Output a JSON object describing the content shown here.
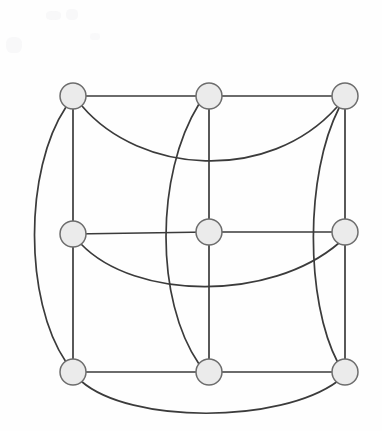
{
  "figure": {
    "canvas": {
      "width": 382,
      "height": 431
    },
    "background_color": "#fefefe",
    "edge_color": "#3b3b3b",
    "vertex_fill_color": "#ebebeb",
    "vertex_stroke_color": "#6d6d6d",
    "vertex_radius": 13,
    "edge_stroke_width": 1.7,
    "vertex_count": 9,
    "edge_count": 18,
    "vertices": [
      {
        "id": "v1",
        "name": "top-left",
        "row": 0,
        "col": 0,
        "cx": 73,
        "cy": 96,
        "degree": 4
      },
      {
        "id": "v2",
        "name": "top-center",
        "row": 0,
        "col": 1,
        "cx": 209,
        "cy": 96,
        "degree": 4
      },
      {
        "id": "v3",
        "name": "top-right",
        "row": 0,
        "col": 2,
        "cx": 345,
        "cy": 96,
        "degree": 4
      },
      {
        "id": "v4",
        "name": "middle-left",
        "row": 1,
        "col": 0,
        "cx": 73,
        "cy": 234,
        "degree": 4
      },
      {
        "id": "v5",
        "name": "middle-center",
        "row": 1,
        "col": 1,
        "cx": 209,
        "cy": 232,
        "degree": 4
      },
      {
        "id": "v6",
        "name": "middle-right",
        "row": 1,
        "col": 2,
        "cx": 345,
        "cy": 232,
        "degree": 4
      },
      {
        "id": "v7",
        "name": "bottom-left",
        "row": 2,
        "col": 0,
        "cx": 73,
        "cy": 372,
        "degree": 4
      },
      {
        "id": "v8",
        "name": "bottom-center",
        "row": 2,
        "col": 1,
        "cx": 209,
        "cy": 372,
        "degree": 4
      },
      {
        "id": "v9",
        "name": "bottom-right",
        "row": 2,
        "col": 2,
        "cx": 345,
        "cy": 372,
        "degree": 4
      }
    ],
    "edges": [
      {
        "id": "e1",
        "from": "v1",
        "to": "v2",
        "kind": "straight",
        "path": "M 73 96 L 209 96"
      },
      {
        "id": "e2",
        "from": "v2",
        "to": "v3",
        "kind": "straight",
        "path": "M 209 96 L 345 96"
      },
      {
        "id": "e3",
        "from": "v4",
        "to": "v5",
        "kind": "straight",
        "path": "M 73 234 L 209 232"
      },
      {
        "id": "e4",
        "from": "v5",
        "to": "v6",
        "kind": "straight",
        "path": "M 209 232 L 345 232"
      },
      {
        "id": "e5",
        "from": "v7",
        "to": "v8",
        "kind": "straight",
        "path": "M 73 372 L 209 372"
      },
      {
        "id": "e6",
        "from": "v8",
        "to": "v9",
        "kind": "straight",
        "path": "M 209 372 L 345 372"
      },
      {
        "id": "e7",
        "from": "v1",
        "to": "v4",
        "kind": "straight",
        "path": "M 73 96 L 73 234"
      },
      {
        "id": "e8",
        "from": "v4",
        "to": "v7",
        "kind": "straight",
        "path": "M 73 234 L 73 372"
      },
      {
        "id": "e9",
        "from": "v2",
        "to": "v5",
        "kind": "straight",
        "path": "M 209 96 L 209 232"
      },
      {
        "id": "e10",
        "from": "v5",
        "to": "v8",
        "kind": "straight",
        "path": "M 209 232 L 209 372"
      },
      {
        "id": "e11",
        "from": "v3",
        "to": "v6",
        "kind": "straight",
        "path": "M 345 96 L 345 232"
      },
      {
        "id": "e12",
        "from": "v6",
        "to": "v9",
        "kind": "straight",
        "path": "M 345 232 L 345 372"
      },
      {
        "id": "e13",
        "from": "v1",
        "to": "v7",
        "kind": "curve-left-outer",
        "path": "M 66 107 C 24 170 24 300 66 362"
      },
      {
        "id": "e14",
        "from": "v1",
        "to": "v3",
        "kind": "curve-top-sag",
        "path": "M 82 106 C 140 174 268 184 337 107"
      },
      {
        "id": "e15",
        "from": "v2",
        "to": "v8",
        "kind": "curve-center-bow",
        "path": "M 199 104 C 155 175 155 300 199 364"
      },
      {
        "id": "e16",
        "from": "v3",
        "to": "v9",
        "kind": "curve-right-bow",
        "path": "M 339 108 C 305 175 305 300 338 363"
      },
      {
        "id": "e17",
        "from": "v4",
        "to": "v6",
        "kind": "curve-mid-sag",
        "path": "M 81 244 C 135 300 270 302 339 243"
      },
      {
        "id": "e18",
        "from": "v7",
        "to": "v9",
        "kind": "curve-bottom-sag",
        "path": "M 81 381 C 130 424 280 424 338 381"
      }
    ]
  }
}
